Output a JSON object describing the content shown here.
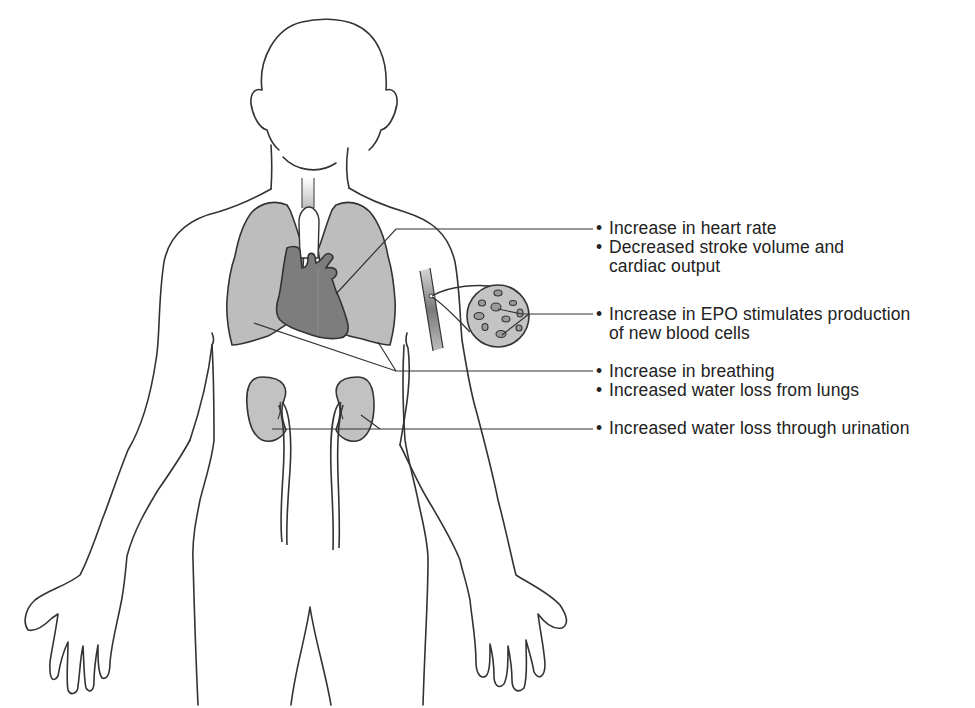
{
  "figure": {
    "type": "anatomical-diagram",
    "colors": {
      "outline": "#333333",
      "lung_fill": "#bdbdbd",
      "heart_fill": "#7d7d7d",
      "kidney_fill": "#c2c2c2",
      "blood_cell_disc_fill": "#c4c4c4",
      "vessel_fill": "#8a8a8a",
      "leader_line": "#333333",
      "text": "#222222"
    }
  },
  "labels": {
    "bullet": "•",
    "heart": {
      "items": [
        {
          "text": "Increase in heart rate"
        },
        {
          "text": "Decreased stroke volume and",
          "continuation": "cardiac output"
        }
      ]
    },
    "blood": {
      "items": [
        {
          "text": "Increase in EPO stimulates production",
          "continuation": "of new blood cells"
        }
      ]
    },
    "lungs": {
      "items": [
        {
          "text": "Increase in breathing"
        },
        {
          "text": "Increased water loss from lungs"
        }
      ]
    },
    "kidneys": {
      "items": [
        {
          "text": "Increased water loss through urination"
        }
      ]
    }
  }
}
